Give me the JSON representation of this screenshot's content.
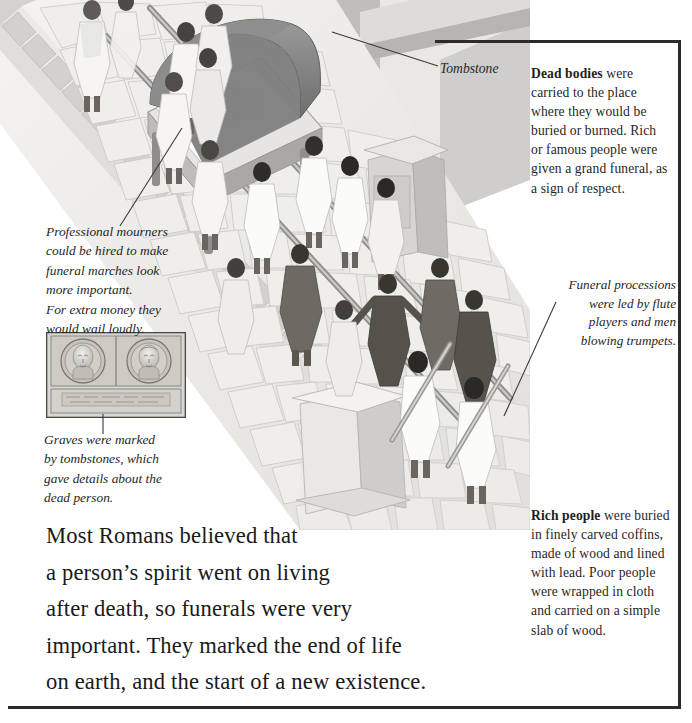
{
  "page": {
    "background": "#ffffff",
    "rule_color": "#2b2b2b"
  },
  "illustration": {
    "name": "roman-funeral-procession",
    "description": "Aerial view of a Roman funeral procession carrying a draped bier along a cobbled street, with mourners, flute players and trumpeters, and tombstones lining the road.",
    "palette": {
      "stone_light": "#f2f1ef",
      "stone_mid": "#dedcd8",
      "stone_shadow": "#c5c3bf",
      "building_grey": "#b9b8b6",
      "dark_robe": "#6b6b6b",
      "skin": "#6f6a63",
      "bier_drape": "#8d8d8d"
    }
  },
  "labels": {
    "tombstone": "Tombstone"
  },
  "captions": {
    "mourners": [
      "Professional mourners",
      "could be hired to make",
      "funeral marches look",
      "more important.",
      "For extra money they",
      "would wail loudly."
    ],
    "graves": [
      "Graves were marked",
      "by tombstones, which",
      "gave details about the",
      "dead person."
    ],
    "processions": [
      "Funeral processions",
      "were led by flute",
      "players and men",
      "blowing trumpets."
    ]
  },
  "sidebar": {
    "dead_bodies": {
      "lead": "Dead bodies",
      "rest": " were carried to the place where they would be buried or burned. Rich or famous people were given a grand funeral, as a sign of respect."
    },
    "rich_people": {
      "lead": "Rich people",
      "rest": " were buried in finely carved coffins, made of wood and lined with lead. Poor people were wrapped in cloth and carried on a simple slab of wood."
    }
  },
  "body": {
    "lines": [
      "Most Romans believed that",
      "a person’s spirit went on living",
      "after death, so funerals were very",
      "important. They marked the end of life",
      "on earth, and the start of a new existence."
    ]
  },
  "relief": {
    "name": "tombstone-relief-portraits",
    "description": "Carved stone tombstone relief showing two portrait busts in circular medallions above an inscription panel."
  }
}
